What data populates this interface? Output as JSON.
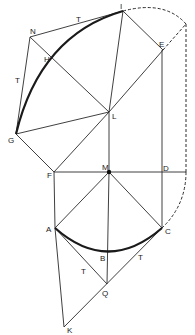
{
  "diagram": {
    "type": "geometric-construction",
    "points": {
      "I": {
        "label": "I",
        "x": 123,
        "y": 11
      },
      "E": {
        "label": "E",
        "x": 163,
        "y": 50
      },
      "N": {
        "label": "N",
        "x": 30,
        "y": 37
      },
      "H": {
        "label": "H",
        "x": 53,
        "y": 60
      },
      "G": {
        "label": "G",
        "x": 16,
        "y": 134
      },
      "L": {
        "label": "L",
        "x": 109,
        "y": 112
      },
      "F": {
        "label": "F",
        "x": 54,
        "y": 172
      },
      "M": {
        "label": "M",
        "x": 109,
        "y": 172
      },
      "D": {
        "label": "D",
        "x": 162,
        "y": 172
      },
      "A": {
        "label": "A",
        "x": 55,
        "y": 228
      },
      "C": {
        "label": "C",
        "x": 162,
        "y": 228
      },
      "B": {
        "label": "B",
        "x": 109,
        "y": 250
      },
      "Q": {
        "label": "Q",
        "x": 107,
        "y": 284
      },
      "K": {
        "label": "K",
        "x": 64,
        "y": 327
      }
    },
    "tangent_labels": [
      {
        "text": "T",
        "x": 78,
        "y": 22
      },
      {
        "text": "T",
        "x": 17,
        "y": 82
      },
      {
        "text": "T",
        "x": 83,
        "y": 273
      },
      {
        "text": "T",
        "x": 140,
        "y": 259
      }
    ]
  }
}
